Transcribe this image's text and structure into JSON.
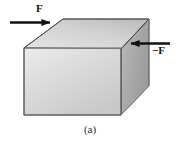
{
  "figure": {
    "caption": "(a)",
    "object": {
      "shape_name": "rectangular-block",
      "description": "Three-dimensional rectangular solid block drawn in oblique projection",
      "face_colors": {
        "front": "#d5d5d5",
        "front_highlight": "#e6e6e6",
        "top": "#c9c9c9",
        "top_highlight": "#dcdcdc",
        "side": "#a9a9a9",
        "side_highlight": "#bdbdbd",
        "edge": "#5a5a5a"
      }
    },
    "forces": [
      {
        "id": "force-left",
        "label": "F",
        "direction": "right",
        "applied_to": "top-left-edge",
        "color": "#111111"
      },
      {
        "id": "force-right",
        "label": "−F",
        "direction": "left",
        "applied_to": "upper-right-edge",
        "color": "#111111"
      }
    ],
    "background_color": "#ffffff"
  }
}
